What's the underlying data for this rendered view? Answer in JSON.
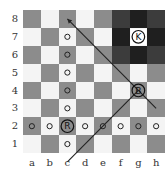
{
  "diagram": {
    "files": [
      "a",
      "b",
      "c",
      "d",
      "e",
      "f",
      "g",
      "h"
    ],
    "ranks": [
      "8",
      "7",
      "6",
      "5",
      "4",
      "3",
      "2",
      "1"
    ],
    "colors": {
      "light_square": "#f4f4f4",
      "dark_square": "#8c8c8c",
      "zone_light": "#3c3c3c",
      "zone_dark": "#1f1f1f",
      "line": "#222222"
    },
    "highlight_zone": [
      "f8",
      "g8",
      "h8",
      "f7",
      "h7",
      "f6",
      "g6",
      "h6"
    ],
    "pieces": [
      {
        "square": "g7",
        "label": "K",
        "name": "king"
      },
      {
        "square": "g4",
        "label": "B",
        "name": "bishop"
      },
      {
        "square": "c2",
        "label": "R",
        "name": "rook"
      }
    ],
    "markers": [
      "c7",
      "c6",
      "c5",
      "c4",
      "c3",
      "c1",
      "a2",
      "b2",
      "d2",
      "e2",
      "f2",
      "g2",
      "h2"
    ],
    "lines": [
      {
        "from": "g4",
        "to": "c8",
        "arrow": true
      },
      {
        "from": "g4",
        "to": "c0",
        "arrow": false
      },
      {
        "from": "g4",
        "to": "h3",
        "arrow": false
      }
    ]
  }
}
